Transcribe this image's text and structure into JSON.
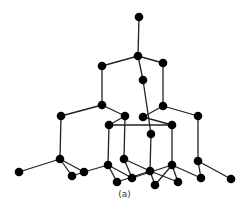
{
  "figure": {
    "caption": "(a)",
    "atom_color": "#000000",
    "bond_color": "#222222",
    "atom_radius": 4.3,
    "atoms": [
      [
        139,
        17
      ],
      [
        138,
        56
      ],
      [
        102,
        66
      ],
      [
        163,
        63
      ],
      [
        143,
        80
      ],
      [
        102,
        105
      ],
      [
        163,
        106
      ],
      [
        61,
        116
      ],
      [
        125,
        116
      ],
      [
        143,
        117
      ],
      [
        198,
        116
      ],
      [
        109,
        125
      ],
      [
        172,
        125
      ],
      [
        151,
        134
      ],
      [
        60,
        159
      ],
      [
        124,
        159
      ],
      [
        198,
        161
      ],
      [
        108,
        165
      ],
      [
        172,
        165
      ],
      [
        19,
        172
      ],
      [
        72,
        176
      ],
      [
        84,
        172
      ],
      [
        117,
        182
      ],
      [
        132,
        178
      ],
      [
        150,
        171
      ],
      [
        155,
        185
      ],
      [
        178,
        182
      ],
      [
        201,
        178
      ],
      [
        231,
        179
      ]
    ],
    "bonds": [
      [
        0,
        1
      ],
      [
        1,
        2
      ],
      [
        1,
        3
      ],
      [
        1,
        4
      ],
      [
        2,
        5
      ],
      [
        3,
        6
      ],
      [
        4,
        13
      ],
      [
        5,
        7
      ],
      [
        5,
        8
      ],
      [
        6,
        9
      ],
      [
        6,
        10
      ],
      [
        8,
        11
      ],
      [
        9,
        12
      ],
      [
        11,
        12
      ],
      [
        7,
        14
      ],
      [
        8,
        15
      ],
      [
        10,
        16
      ],
      [
        11,
        17
      ],
      [
        12,
        18
      ],
      [
        13,
        24
      ],
      [
        14,
        19
      ],
      [
        14,
        20
      ],
      [
        14,
        21
      ],
      [
        21,
        17
      ],
      [
        20,
        21
      ],
      [
        17,
        22
      ],
      [
        17,
        23
      ],
      [
        15,
        23
      ],
      [
        15,
        24
      ],
      [
        24,
        25
      ],
      [
        24,
        26
      ],
      [
        18,
        26
      ],
      [
        18,
        27
      ],
      [
        16,
        27
      ],
      [
        16,
        28
      ],
      [
        22,
        24
      ],
      [
        23,
        18
      ],
      [
        25,
        18
      ]
    ]
  }
}
